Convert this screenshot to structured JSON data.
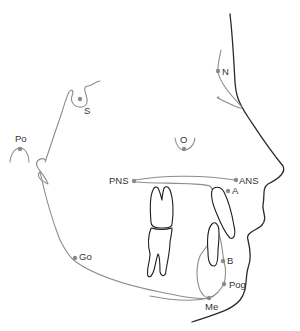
{
  "diagram": {
    "type": "cephalometric-tracing",
    "colors": {
      "soft_tissue": "#2a2a2a",
      "bone": "#8c8c8c",
      "landmark": "#8a8a8a",
      "label": "#333333"
    },
    "landmarks": [
      {
        "id": "S",
        "label": "S",
        "x": 80,
        "y": 99
      },
      {
        "id": "N",
        "label": "N",
        "x": 218,
        "y": 71
      },
      {
        "id": "Po",
        "label": "Po",
        "x": 19,
        "y": 148
      },
      {
        "id": "O",
        "label": "O",
        "x": 184,
        "y": 149
      },
      {
        "id": "PNS",
        "label": "PNS",
        "x": 133,
        "y": 181
      },
      {
        "id": "ANS",
        "label": "ANS",
        "x": 235,
        "y": 180
      },
      {
        "id": "A",
        "label": "A",
        "x": 228,
        "y": 191
      },
      {
        "id": "Go",
        "label": "Go",
        "x": 75,
        "y": 258
      },
      {
        "id": "B",
        "label": "B",
        "x": 223,
        "y": 261
      },
      {
        "id": "Pog",
        "label": "Pog",
        "x": 224,
        "y": 284
      },
      {
        "id": "Me",
        "label": "Me",
        "x": 209,
        "y": 298
      }
    ]
  }
}
